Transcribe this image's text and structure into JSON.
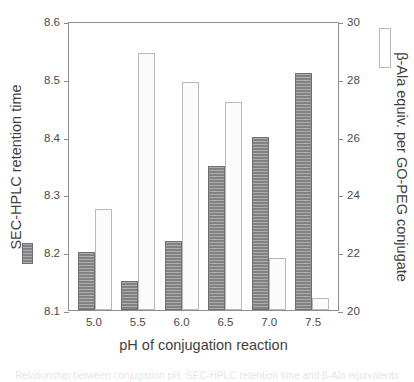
{
  "chart_data": {
    "type": "bar",
    "title": "",
    "subtitle": "",
    "xlabel": "pH of conjugation reaction",
    "categories": [
      "5.0",
      "5.5",
      "6.0",
      "6.5",
      "7.0",
      "7.5"
    ],
    "grid": false,
    "legend_position": "beside-axis-titles",
    "axes": {
      "left": {
        "label": "SEC-HPLC retention time",
        "ylim": [
          8.1,
          8.6
        ],
        "ticks": [
          "8.1",
          "8.2",
          "8.3",
          "8.4",
          "8.5",
          "8.6"
        ],
        "tick_values": [
          8.1,
          8.2,
          8.3,
          8.4,
          8.5,
          8.6
        ]
      },
      "right": {
        "label": "β-Ala equiv. per GO-PEG conjugate",
        "ylim": [
          20,
          30
        ],
        "ticks": [
          "20",
          "22",
          "24",
          "26",
          "28",
          "30"
        ],
        "tick_values": [
          20,
          22,
          24,
          26,
          28,
          30
        ],
        "axis_bottom_value": 19.0
      }
    },
    "series": [
      {
        "name": "SEC-HPLC retention time",
        "axis": "left",
        "style": "filled-hatched-gray",
        "color": "#8a8a8a",
        "values": [
          8.2,
          8.15,
          8.22,
          8.35,
          8.4,
          8.51
        ]
      },
      {
        "name": "β-Ala equiv. per GO-PEG conjugate",
        "axis": "right",
        "style": "open-white",
        "color": "#fbfbfb",
        "values": [
          22.5,
          27.9,
          26.9,
          26.2,
          20.8,
          19.4
        ]
      }
    ]
  },
  "caption_remnant": "Relationship between conjugation pH, SEC-HPLC retention time and β-Ala equivalents"
}
